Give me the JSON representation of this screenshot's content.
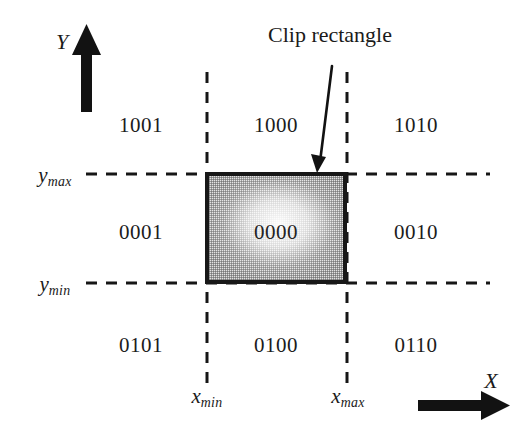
{
  "figure": {
    "background_color": "#ffffff",
    "ink_color": "#1a1a1a"
  },
  "caption": {
    "text": "Clip rectangle",
    "pointer": "arrow-to-rectangle-top-edge"
  },
  "axes": {
    "y": {
      "label": "Y",
      "direction": "up"
    },
    "x": {
      "label": "X",
      "direction": "right"
    }
  },
  "boundaries": {
    "y_max": {
      "symbol": "y",
      "subscript": "max"
    },
    "y_min": {
      "symbol": "y",
      "subscript": "min"
    },
    "x_min": {
      "symbol": "x",
      "subscript": "min"
    },
    "x_max": {
      "symbol": "x",
      "subscript": "max"
    }
  },
  "region_codes": {
    "top_left": "1001",
    "top_center": "1000",
    "top_right": "1010",
    "middle_left": "0001",
    "middle_center": "0000",
    "middle_right": "0010",
    "bottom_left": "0101",
    "bottom_center": "0100",
    "bottom_right": "0110"
  },
  "clip_rectangle": {
    "fill": "halftone-gray",
    "border_color": "#181818",
    "inside_code": "0000"
  }
}
